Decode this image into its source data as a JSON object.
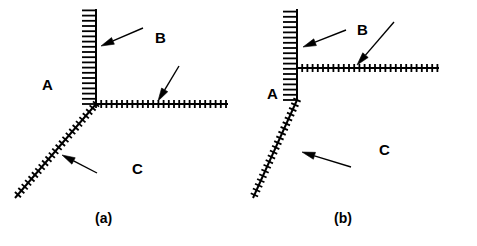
{
  "figure": {
    "width": 477,
    "height": 246,
    "background_color": "#ffffff",
    "ink_color": "#000000"
  },
  "panels": [
    {
      "id": "a",
      "caption": "(a)",
      "caption_pos": {
        "x": 95,
        "y": 211
      },
      "description": "single triple junction where vertical, horizontal and diagonal hatched interfaces meet at one point",
      "junctions": [
        {
          "name": "triple-point",
          "x": 96,
          "y": 104
        }
      ],
      "interfaces": [
        {
          "name": "vertical-interface",
          "x1": 96,
          "y1": 104,
          "x2": 96,
          "y2": 9,
          "tick_side": "left",
          "tick_len": 7,
          "tick_spacing": 5.2
        },
        {
          "name": "horizontal-interface",
          "x1": 96,
          "y1": 104,
          "x2": 228,
          "y2": 104,
          "tick_side": "both",
          "tick_len": 4,
          "tick_spacing": 5.2
        },
        {
          "name": "diagonal-interface",
          "x1": 96,
          "y1": 104,
          "x2": 15,
          "y2": 198,
          "tick_side": "both",
          "tick_len": 4,
          "tick_spacing": 5.2
        }
      ],
      "labels": [
        {
          "name": "region-label-a",
          "text": "A",
          "x": 42,
          "y": 77
        },
        {
          "name": "region-label-b",
          "text": "B",
          "x": 155,
          "y": 30
        },
        {
          "name": "region-label-c",
          "text": "C",
          "x": 132,
          "y": 161
        }
      ],
      "arrows": [
        {
          "name": "arrow-to-vertical-interface",
          "x1": 143,
          "y1": 28,
          "x2": 101,
          "y2": 46,
          "points_at": "vertical-interface"
        },
        {
          "name": "arrow-to-horizontal-interface",
          "x1": 179,
          "y1": 66,
          "x2": 158,
          "y2": 101,
          "points_at": "horizontal-interface"
        },
        {
          "name": "arrow-to-diagonal-interface",
          "x1": 97,
          "y1": 173,
          "x2": 62,
          "y2": 155,
          "points_at": "diagonal-interface"
        }
      ]
    },
    {
      "id": "b",
      "caption": "(b)",
      "caption_pos": {
        "x": 95,
        "y": 211
      },
      "description": "dissociated junction: horizontal interface meets the vertical interface at an upper T-junction, the vertical interface bends into the diagonal interface lower down",
      "junctions": [
        {
          "name": "upper-t-junction",
          "x": 58,
          "y": 68
        },
        {
          "name": "lower-bend-junction",
          "x": 58,
          "y": 100
        }
      ],
      "interfaces": [
        {
          "name": "vertical-interface",
          "x1": 58,
          "y1": 100,
          "x2": 58,
          "y2": 9,
          "tick_side": "left",
          "tick_len": 7,
          "tick_spacing": 5.2
        },
        {
          "name": "horizontal-interface",
          "x1": 58,
          "y1": 68,
          "x2": 200,
          "y2": 68,
          "tick_side": "both",
          "tick_len": 4,
          "tick_spacing": 5.2
        },
        {
          "name": "diagonal-interface",
          "x1": 58,
          "y1": 100,
          "x2": 14,
          "y2": 198,
          "tick_side": "both",
          "tick_len": 4,
          "tick_spacing": 5.2
        }
      ],
      "labels": [
        {
          "name": "region-label-a",
          "text": "A",
          "x": 28,
          "y": 86
        },
        {
          "name": "region-label-b",
          "text": "B",
          "x": 118,
          "y": 22
        },
        {
          "name": "region-label-c",
          "text": "C",
          "x": 140,
          "y": 142
        }
      ],
      "arrows": [
        {
          "name": "arrow-to-vertical-interface",
          "x1": 107,
          "y1": 30,
          "x2": 64,
          "y2": 47,
          "points_at": "vertical-interface"
        },
        {
          "name": "arrow-to-horizontal-interface",
          "x1": 155,
          "y1": 22,
          "x2": 118,
          "y2": 65,
          "points_at": "horizontal-interface"
        },
        {
          "name": "arrow-to-diagonal-interface",
          "x1": 112,
          "y1": 167,
          "x2": 63,
          "y2": 152,
          "points_at": "diagonal-interface"
        }
      ]
    }
  ]
}
